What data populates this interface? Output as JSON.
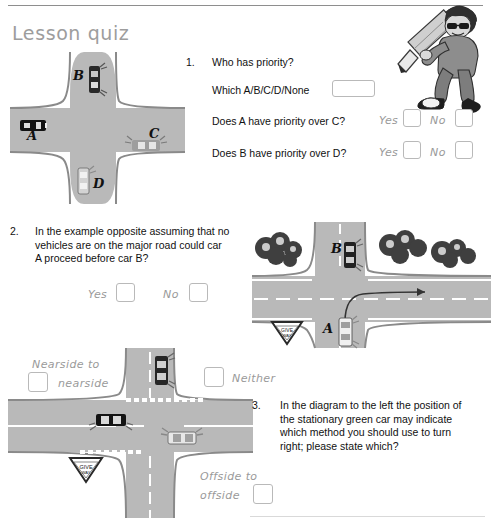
{
  "header": {
    "title": "Lesson quiz"
  },
  "questions": [
    {
      "number": "1.",
      "text": "Who has priority?",
      "sub_label": "Which A/B/C/D/None",
      "sub_value": "",
      "rows": [
        {
          "prompt": "Does A have priority over C?",
          "yes_label": "Yes",
          "no_label": "No"
        },
        {
          "prompt": "Does B have priority over D?",
          "yes_label": "Yes",
          "no_label": "No"
        }
      ]
    },
    {
      "number": "2.",
      "text": "In the example opposite assuming that no vehicles are on the major road could car A proceed before car B?",
      "yes_label": "Yes",
      "no_label": "No"
    },
    {
      "number": "3.",
      "text": "In the diagram to the left the position of the stationary green car may indicate which method you should use to turn right; please state which?"
    }
  ],
  "q3_options": {
    "nearside": "Nearside to nearside",
    "neither": "Neither",
    "offside": "Offside to offside"
  },
  "diagrams": {
    "crossroads": {
      "name": "crossroads-diagram",
      "car_labels": [
        "A",
        "B",
        "C",
        "D"
      ]
    },
    "tjunction": {
      "name": "t-junction-diagram",
      "car_labels": [
        "A",
        "B"
      ],
      "sign_text": "GIVE WAY"
    },
    "turnright": {
      "name": "turn-right-diagram",
      "sign_text": "GIVE WAY"
    }
  },
  "mascot": {
    "name": "cartoon-student-with-pencil"
  },
  "colors": {
    "road": "#b9b9b9",
    "road_edge": "#8a8a8a",
    "title": "#9d9d9d",
    "hand_label": "#9a9a9a",
    "box_border": "#b9b9b9"
  }
}
